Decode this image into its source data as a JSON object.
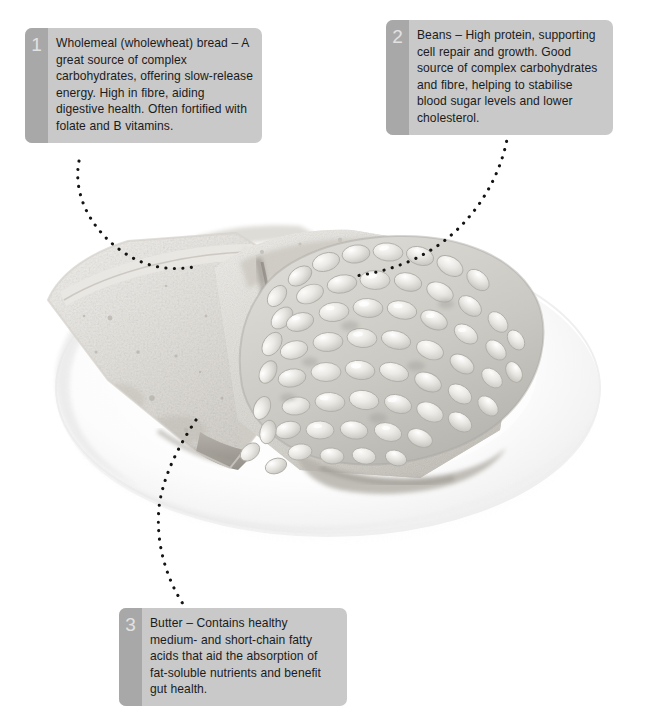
{
  "page": {
    "background_color": "#ffffff",
    "width": 661,
    "height": 703
  },
  "photo": {
    "subject": "plate-of-baked-beans-on-wholemeal-toast",
    "description": "Overhead three-quarter photo of a white round plate holding two slices of wholemeal toast, the right slice covered with baked beans in sauce.",
    "style": "desaturated grayscale photograph on white background",
    "elements": [
      "white-round-plate",
      "wholemeal-toast-slice-left",
      "wholemeal-toast-slice-right",
      "baked-beans-pile"
    ]
  },
  "colors": {
    "callout_background": "#c9c9c9",
    "callout_number_strip": "#a8a8a8",
    "callout_number_text": "#e2e2e2",
    "callout_body_text": "#1b1b1b",
    "leader_dot": "#141414",
    "plate_white": "#fefefe",
    "plate_shadow": "#ececec",
    "bread_light": "#ededeb",
    "bread_mid": "#dcdad6",
    "bread_dark": "#b9b6b0",
    "crust": "#9a968f",
    "bean_light": "#f0efec",
    "bean_mid": "#dbdad6",
    "sauce": "#cbc9c4"
  },
  "callouts": [
    {
      "number": "1",
      "name": "wholemeal-bread",
      "text": "Wholemeal (wholewheat) bread – A great source of complex carbohydrates, offering slow-release energy. High in fibre, aiding digestive health. Often fortified with folate and B vitamins."
    },
    {
      "number": "2",
      "name": "beans",
      "text": "Beans – High protein, supporting cell repair and growth. Good source of complex carbohydrates and fibre, helping to stabilise blood sugar levels and lower cholesterol."
    },
    {
      "number": "3",
      "name": "butter",
      "text": "Butter – Contains healthy medium- and short-chain fatty acids that aid the absorption of fat-soluble nutrients and benefit gut health."
    }
  ],
  "leaders": [
    {
      "name": "leader-line-1",
      "from_callout": "1",
      "path": "M 79 161 C 73 192, 88 226, 120 250 C 148 270, 175 271, 199 266"
    },
    {
      "name": "leader-line-2",
      "from_callout": "2",
      "path": "M 508 133 C 503 170, 480 215, 440 244 C 415 262, 385 272, 355 276"
    },
    {
      "name": "leader-line-3",
      "from_callout": "3",
      "path": "M 196 420 C 180 444, 166 470, 160 500 C 154 538, 165 576, 183 604"
    }
  ]
}
